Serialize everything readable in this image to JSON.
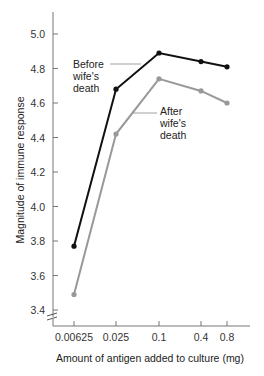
{
  "chart_data": {
    "type": "line",
    "title": "",
    "xlabel": "Amount of antigen added to culture (mg)",
    "ylabel": "Magnitude of immune response",
    "categories": [
      "0.00625",
      "0.025",
      "0.1",
      "0.4",
      "0.8"
    ],
    "series": [
      {
        "name": "Before wife's death",
        "color": "#111111",
        "values": [
          3.77,
          4.68,
          4.89,
          4.84,
          4.81
        ]
      },
      {
        "name": "After wife's death",
        "color": "#999999",
        "values": [
          3.49,
          4.42,
          4.74,
          4.67,
          4.6
        ]
      }
    ],
    "yticks": [
      "3.4",
      "3.6",
      "3.8",
      "4.0",
      "4.2",
      "4.4",
      "4.6",
      "4.8",
      "5.0"
    ],
    "ylim": [
      3.35,
      5.1
    ],
    "axis_break": true,
    "grid": false,
    "annotations": [
      {
        "lines": [
          "Before",
          "wife's",
          "death"
        ],
        "series": "Before wife's death"
      },
      {
        "lines": [
          "After",
          "wife's",
          "death"
        ],
        "series": "After wife's death"
      }
    ]
  }
}
